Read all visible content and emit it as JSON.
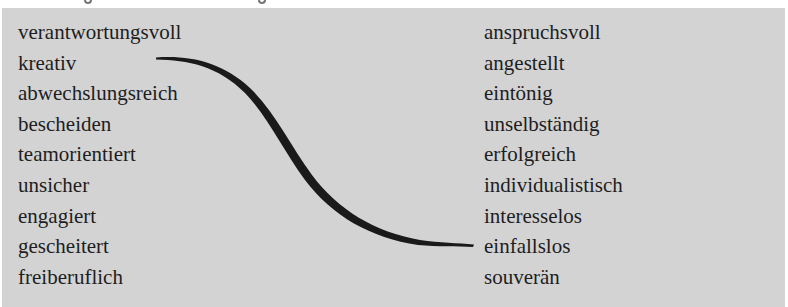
{
  "exercise": {
    "left_words": [
      "verantwortungsvoll",
      "kreativ",
      "abwechslungsreich",
      "bescheiden",
      "teamorientiert",
      "unsicher",
      "engagiert",
      "gescheitert",
      "freiberuflich"
    ],
    "right_words": [
      "anspruchsvoll",
      "angestellt",
      "eintönig",
      "unselbständig",
      "erfolgreich",
      "individualistisch",
      "interesselos",
      "einfallslos",
      "souverän"
    ],
    "connection": {
      "from": "kreativ",
      "to": "einfallslos",
      "color": "#1a1a1a"
    },
    "box_color": "#d3d3d3"
  }
}
